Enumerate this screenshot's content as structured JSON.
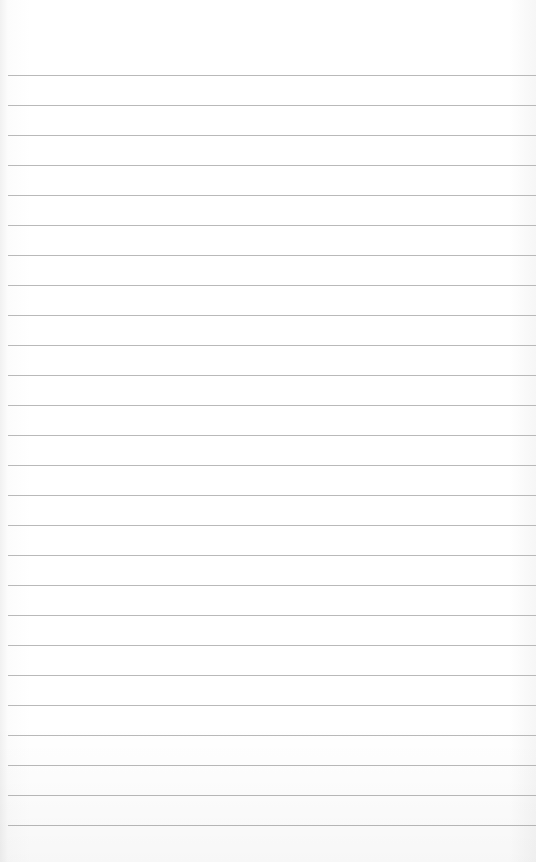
{
  "paper": {
    "type": "ruled-notepad",
    "background_color": "#ffffff",
    "line_color": "#b9b9b9",
    "first_line_y": 75,
    "line_spacing": 30,
    "line_count": 26
  }
}
